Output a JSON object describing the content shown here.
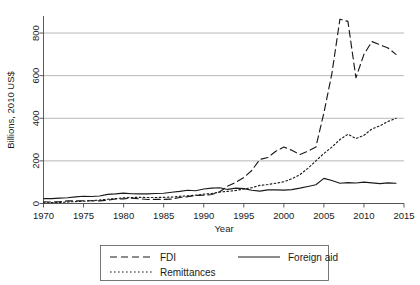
{
  "chart_data": {
    "type": "line",
    "title": "",
    "xlabel": "Year",
    "ylabel": "Billions, 2010 US$",
    "xlim": [
      1970,
      2015
    ],
    "ylim": [
      0,
      880
    ],
    "xticks": [
      1970,
      1975,
      1980,
      1985,
      1990,
      1995,
      2000,
      2005,
      2010,
      2015
    ],
    "yticks": [
      0,
      200,
      400,
      600,
      800
    ],
    "grid": "horizontal",
    "legend_position": "bottom",
    "x": [
      1970,
      1971,
      1972,
      1973,
      1974,
      1975,
      1976,
      1977,
      1978,
      1979,
      1980,
      1981,
      1982,
      1983,
      1984,
      1985,
      1986,
      1987,
      1988,
      1989,
      1990,
      1991,
      1992,
      1993,
      1994,
      1995,
      1996,
      1997,
      1998,
      1999,
      2000,
      2001,
      2002,
      2003,
      2004,
      2005,
      2006,
      2007,
      2008,
      2009,
      2010,
      2011,
      2012,
      2013,
      2014
    ],
    "series": [
      {
        "name": "FDI",
        "style": "dashed",
        "values": [
          8,
          7,
          8,
          12,
          12,
          13,
          13,
          12,
          16,
          21,
          22,
          25,
          22,
          19,
          20,
          19,
          21,
          28,
          32,
          38,
          39,
          42,
          55,
          82,
          99,
          122,
          155,
          207,
          216,
          245,
          265,
          250,
          230,
          245,
          265,
          425,
          610,
          865,
          855,
          590,
          700,
          760,
          745,
          730,
          700
        ]
      },
      {
        "name": "Remittances",
        "style": "dotted",
        "values": [
          3,
          4,
          5,
          7,
          9,
          11,
          13,
          16,
          20,
          23,
          27,
          28,
          29,
          28,
          28,
          29,
          30,
          34,
          36,
          39,
          44,
          47,
          54,
          57,
          61,
          68,
          74,
          85,
          89,
          95,
          102,
          116,
          135,
          165,
          200,
          235,
          265,
          300,
          325,
          305,
          320,
          350,
          365,
          385,
          400
        ]
      },
      {
        "name": "Foreign aid",
        "style": "solid",
        "values": [
          23,
          23,
          25,
          27,
          31,
          34,
          33,
          35,
          43,
          45,
          49,
          46,
          45,
          45,
          47,
          48,
          53,
          57,
          62,
          60,
          68,
          72,
          74,
          66,
          72,
          70,
          62,
          58,
          64,
          64,
          63,
          65,
          72,
          80,
          88,
          118,
          108,
          95,
          98,
          96,
          100,
          97,
          93,
          97,
          95
        ]
      }
    ],
    "annotations": []
  },
  "legend": {
    "items": [
      {
        "label": "FDI",
        "style": "dashed"
      },
      {
        "label": "Foreign aid",
        "style": "solid"
      },
      {
        "label": "Remittances",
        "style": "dotted"
      }
    ]
  }
}
